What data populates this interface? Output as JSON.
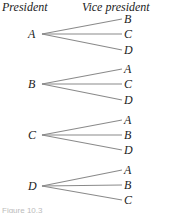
{
  "headers": {
    "left": "President",
    "right": "Vice president"
  },
  "tree": [
    {
      "root": "A",
      "root_y": 34,
      "leaves": [
        {
          "label": "B",
          "y": 19
        },
        {
          "label": "C",
          "y": 34
        },
        {
          "label": "D",
          "y": 50
        }
      ]
    },
    {
      "root": "B",
      "root_y": 84,
      "leaves": [
        {
          "label": "A",
          "y": 69
        },
        {
          "label": "C",
          "y": 84
        },
        {
          "label": "D",
          "y": 100
        }
      ]
    },
    {
      "root": "C",
      "root_y": 135,
      "leaves": [
        {
          "label": "A",
          "y": 120
        },
        {
          "label": "B",
          "y": 135
        },
        {
          "label": "D",
          "y": 150
        }
      ]
    },
    {
      "root": "D",
      "root_y": 186,
      "leaves": [
        {
          "label": "A",
          "y": 170
        },
        {
          "label": "B",
          "y": 185
        },
        {
          "label": "C",
          "y": 200
        }
      ]
    }
  ],
  "colors": {
    "line": "#8a8a8a",
    "text": "#222222"
  },
  "caption": "Figure 10.3"
}
